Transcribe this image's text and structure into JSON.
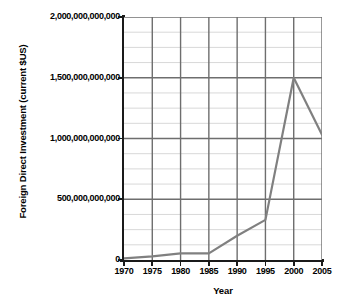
{
  "chart_data": {
    "type": "line",
    "title": "",
    "xlabel": "Year",
    "ylabel": "Foreign Direct Investment (current $US)",
    "x": [
      1970,
      1975,
      1980,
      1985,
      1990,
      1995,
      2000,
      2005
    ],
    "values": [
      13000000000,
      30000000000,
      55000000000,
      55000000000,
      200000000000,
      330000000000,
      1500000000000,
      1030000000000
    ],
    "series": [
      {
        "name": "Foreign Direct Investment",
        "values": [
          13000000000,
          30000000000,
          55000000000,
          55000000000,
          200000000000,
          330000000000,
          1500000000000,
          1030000000000
        ]
      }
    ],
    "xlim": [
      1970,
      2005
    ],
    "ylim": [
      0,
      2000000000000
    ],
    "x_tick_labels": [
      "1970",
      "1975",
      "1980",
      "1985",
      "1990",
      "1995",
      "2000",
      "2005"
    ],
    "y_tick_values": [
      0,
      500000000000,
      1000000000000,
      1500000000000,
      2000000000000
    ],
    "y_tick_labels": [
      "0",
      "500,000,000,000",
      "1,000,000,000,000",
      "1,500,000,000,000",
      "2,000,000,000,000"
    ],
    "grid": true,
    "minor_gridlines_per_major": 4,
    "legend": "none",
    "line_color": "#808080",
    "major_grid_color": "#6e6e6e",
    "minor_grid_color": "#d8d8d8",
    "axis_color": "#1a1a1a",
    "background_color": "#ffffff"
  }
}
